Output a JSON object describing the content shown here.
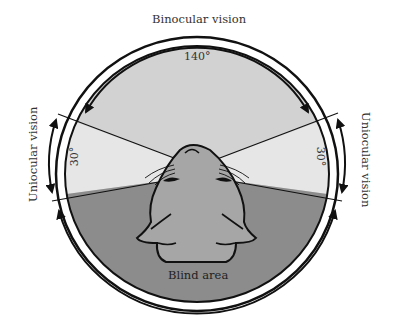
{
  "diagram": {
    "title": "Binocular vision",
    "labels": {
      "binocular": "Binocular vision",
      "uniocular_left": "Uniocular vision",
      "uniocular_right": "Uniocular vision",
      "blind": "Blind area"
    },
    "angles": {
      "binocular": "140°",
      "uniocular_left": "30°",
      "uniocular_right": "30°"
    },
    "colors": {
      "binocular_zone": "#d2d2d2",
      "uniocular_zone": "#e6e6e6",
      "blind_zone": "#8c8c8c",
      "seal_head": "#a6a6a6",
      "outline": "#111111"
    }
  }
}
